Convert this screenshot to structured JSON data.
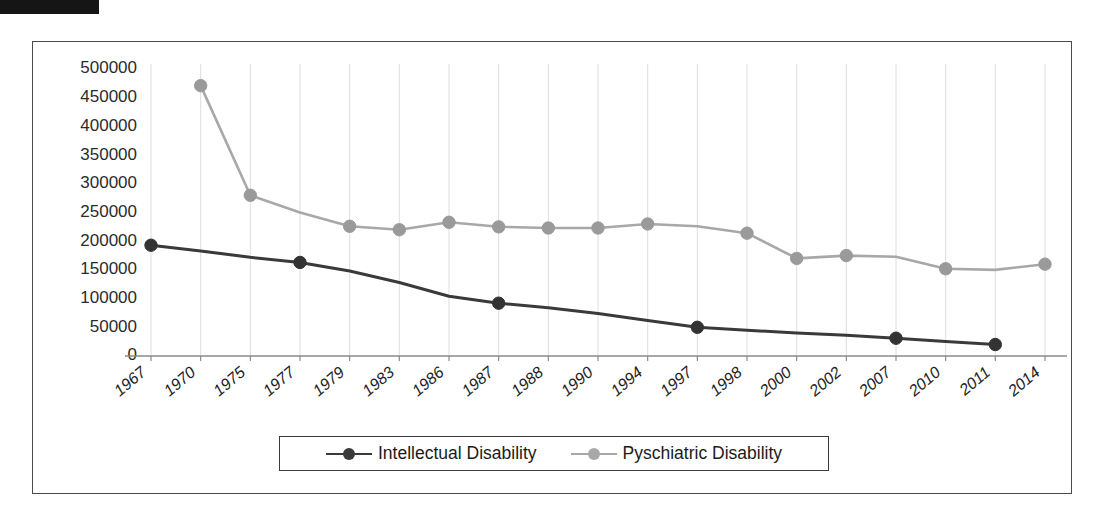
{
  "page": {
    "redaction_label": "redacted-black-bar",
    "caption_faint": ""
  },
  "chart_data": {
    "type": "line",
    "title": "",
    "xlabel": "",
    "ylabel": "",
    "ylim": [
      0,
      500000
    ],
    "ytick_step": 50000,
    "yticks": [
      "500000",
      "450000",
      "400000",
      "350000",
      "300000",
      "250000",
      "200000",
      "150000",
      "100000",
      "50000",
      "0"
    ],
    "grid": "vertical-only",
    "legend_position": "bottom-center",
    "categories": [
      "1967",
      "1970",
      "1975",
      "1977",
      "1979",
      "1983",
      "1986",
      "1987",
      "1988",
      "1990",
      "1994",
      "1997",
      "1998",
      "2000",
      "2002",
      "2007",
      "2010",
      "2011",
      "2014"
    ],
    "series": [
      {
        "name": "Intellectual Disability",
        "color": "#3a3a3a",
        "marker_color": "#333333",
        "marker_indices": [
          0,
          3,
          7,
          11,
          15,
          17
        ],
        "values": [
          193000,
          183000,
          172000,
          163000,
          148000,
          128000,
          104000,
          92000,
          84000,
          74000,
          62000,
          50000,
          45000,
          40000,
          36000,
          31000,
          25000,
          20000,
          null
        ]
      },
      {
        "name": "Pyschiatric Disability",
        "color": "#a8a8a8",
        "marker_color": "#9a9a9a",
        "marker_indices": [
          1,
          2,
          4,
          5,
          6,
          7,
          8,
          9,
          10,
          12,
          13,
          14,
          16,
          18
        ],
        "values": [
          null,
          471000,
          280000,
          250000,
          226000,
          220000,
          233000,
          225000,
          223000,
          223000,
          230000,
          226000,
          214000,
          170000,
          175000,
          173000,
          152000,
          150000,
          160000
        ]
      }
    ]
  },
  "legend": {
    "items": [
      {
        "label": "Intellectual Disability",
        "color": "#3a3a3a"
      },
      {
        "label": "Pyschiatric Disability",
        "color": "#a8a8a8"
      }
    ]
  }
}
